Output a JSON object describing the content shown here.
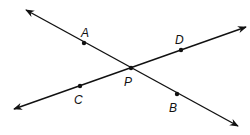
{
  "diagram": {
    "type": "intersecting-lines",
    "lines": [
      {
        "name": "line-AB",
        "from": [
          26,
          10
        ],
        "to": [
          238,
          126
        ]
      },
      {
        "name": "line-CD",
        "from": [
          14,
          109
        ],
        "to": [
          246,
          27
        ]
      }
    ],
    "points": [
      {
        "label": "A",
        "x": 84,
        "y": 43,
        "lx": 81,
        "ly": 37
      },
      {
        "label": "D",
        "x": 181,
        "y": 50,
        "lx": 175,
        "ly": 44
      },
      {
        "label": "P",
        "x": 131,
        "y": 68,
        "lx": 124,
        "ly": 86
      },
      {
        "label": "C",
        "x": 80,
        "y": 86,
        "lx": 74,
        "ly": 104
      },
      {
        "label": "B",
        "x": 177,
        "y": 94,
        "lx": 169,
        "ly": 112
      }
    ],
    "color": "#111111"
  }
}
